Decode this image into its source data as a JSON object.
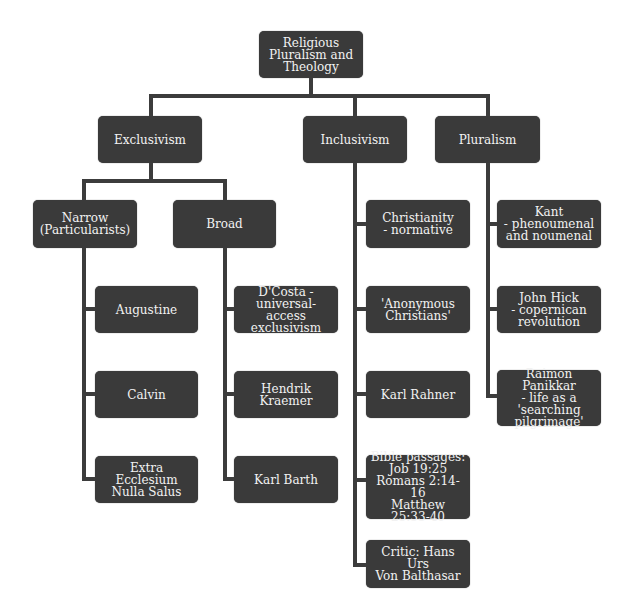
{
  "diagram": {
    "type": "hierarchy",
    "root": {
      "label": "Religious\nPluralism and\nTheology"
    },
    "level1": [
      {
        "label": "Exclusivism"
      },
      {
        "label": "Inclusivism"
      },
      {
        "label": "Pluralism"
      }
    ],
    "exclusivism": {
      "narrow": {
        "label": "Narrow\n(Particularists)",
        "children": [
          {
            "label": "Augustine"
          },
          {
            "label": "Calvin"
          },
          {
            "label": "Extra Ecclesium\nNulla Salus"
          }
        ]
      },
      "broad": {
        "label": "Broad",
        "children": [
          {
            "label": "D'Costa -\nuniversal-access\nexclusivism"
          },
          {
            "label": "Hendrik\nKraemer"
          },
          {
            "label": "Karl Barth"
          }
        ]
      }
    },
    "inclusivism": {
      "children": [
        {
          "label": "Christianity\n- normative"
        },
        {
          "label": "'Anonymous\nChristians'"
        },
        {
          "label": "Karl Rahner"
        },
        {
          "label": "Bible passages:\nJob 19:25\nRomans 2:14-16\nMatthew\n25:33-40"
        },
        {
          "label": "Critic: Hans Urs\nVon Balthasar"
        }
      ]
    },
    "pluralism": {
      "children": [
        {
          "label": "Kant\n- phenoumenal\nand noumenal"
        },
        {
          "label": "John Hick\n- copernican\nrevolution"
        },
        {
          "label": "Raimon Panikkar\n- life as a\n'searching\npilgrimage'"
        }
      ]
    },
    "colors": {
      "node_fill": "#3a3a3a",
      "node_text": "#f2f2f2",
      "connector": "#3c3c3c",
      "background": "#ffffff"
    }
  }
}
